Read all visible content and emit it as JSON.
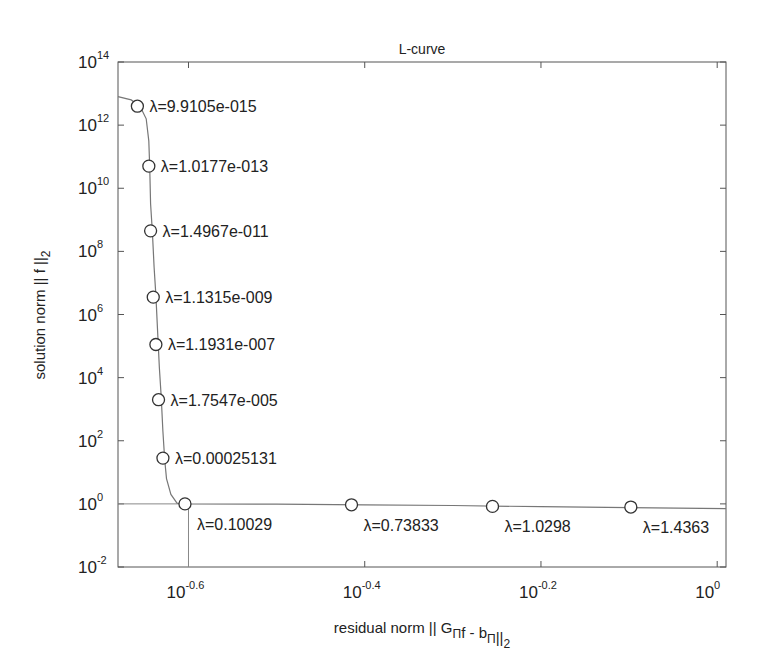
{
  "chart_data": {
    "type": "line",
    "title": "L-curve",
    "xlabel": "residual norm || G_Π f - b_Π||_2",
    "ylabel": "solution norm || f ||_2",
    "xscale": "log",
    "yscale": "log",
    "xlim_log10": [
      -0.68,
      0.01
    ],
    "ylim_log10": [
      -2,
      14
    ],
    "grid": false,
    "x_ticks": [
      {
        "label_base": "10",
        "label_exp": "-0.6",
        "log10": -0.6
      },
      {
        "label_base": "10",
        "label_exp": "-0.4",
        "log10": -0.4
      },
      {
        "label_base": "10",
        "label_exp": "-0.2",
        "log10": -0.2
      },
      {
        "label_base": "10",
        "label_exp": "0",
        "log10": 0
      }
    ],
    "y_ticks": [
      {
        "label_base": "10",
        "label_exp": "14",
        "log10": 14
      },
      {
        "label_base": "10",
        "label_exp": "12",
        "log10": 12
      },
      {
        "label_base": "10",
        "label_exp": "10",
        "log10": 10
      },
      {
        "label_base": "10",
        "label_exp": "8",
        "log10": 8
      },
      {
        "label_base": "10",
        "label_exp": "6",
        "log10": 6
      },
      {
        "label_base": "10",
        "label_exp": "4",
        "log10": 4
      },
      {
        "label_base": "10",
        "label_exp": "2",
        "log10": 2
      },
      {
        "label_base": "10",
        "label_exp": "0",
        "log10": 0
      },
      {
        "label_base": "10",
        "label_exp": "-2",
        "log10": -2
      }
    ],
    "curve_log10": [
      [
        -0.68,
        12.9
      ],
      [
        -0.665,
        12.8
      ],
      [
        -0.655,
        12.6
      ],
      [
        -0.648,
        12.2
      ],
      [
        -0.645,
        11.5
      ],
      [
        -0.644,
        10.7
      ],
      [
        -0.643,
        9.5
      ],
      [
        -0.641,
        8.6
      ],
      [
        -0.639,
        7.5
      ],
      [
        -0.637,
        6.6
      ],
      [
        -0.635,
        5.4
      ],
      [
        -0.633,
        4.3
      ],
      [
        -0.631,
        3.4
      ],
      [
        -0.629,
        2.3
      ],
      [
        -0.627,
        1.4
      ],
      [
        -0.625,
        0.8
      ],
      [
        -0.62,
        0.3
      ],
      [
        -0.613,
        0.02
      ],
      [
        -0.604,
        0.0
      ],
      [
        -0.5,
        -0.01
      ],
      [
        -0.4,
        -0.03
      ],
      [
        -0.3,
        -0.05
      ],
      [
        -0.2,
        -0.09
      ],
      [
        -0.1,
        -0.12
      ],
      [
        0.01,
        -0.15
      ]
    ],
    "series": [
      {
        "name": "regularization points",
        "marker": "circle-open",
        "points": [
          {
            "lambda_label": "λ=9.9105e-015",
            "x_log10": -0.658,
            "y_log10": 12.6
          },
          {
            "lambda_label": "λ=1.0177e-013",
            "x_log10": -0.645,
            "y_log10": 10.7
          },
          {
            "lambda_label": "λ=1.4967e-011",
            "x_log10": -0.643,
            "y_log10": 8.65
          },
          {
            "lambda_label": "λ=1.1315e-009",
            "x_log10": -0.64,
            "y_log10": 6.55
          },
          {
            "lambda_label": "λ=1.1931e-007",
            "x_log10": -0.637,
            "y_log10": 5.05
          },
          {
            "lambda_label": "λ=1.7547e-005",
            "x_log10": -0.634,
            "y_log10": 3.3
          },
          {
            "lambda_label": "λ=0.00025131",
            "x_log10": -0.629,
            "y_log10": 1.45
          },
          {
            "lambda_label": "λ=0.10029",
            "x_log10": -0.604,
            "y_log10": 0.0
          },
          {
            "lambda_label": "λ=0.73833",
            "x_log10": -0.415,
            "y_log10": -0.03
          },
          {
            "lambda_label": "λ=1.0298",
            "x_log10": -0.255,
            "y_log10": -0.08
          },
          {
            "lambda_label": "λ=1.4363",
            "x_log10": -0.098,
            "y_log10": -0.1
          }
        ]
      }
    ],
    "corner_crosshair": {
      "x_log10": -0.6,
      "y_log10": 0.0
    }
  }
}
